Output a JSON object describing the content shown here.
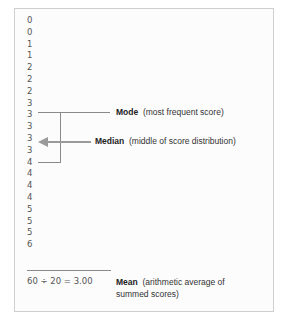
{
  "scores": [
    "0",
    "0",
    "1",
    "1",
    "2",
    "2",
    "2",
    "3",
    "3",
    "3",
    "3",
    "3",
    "4",
    "4",
    "4",
    "4",
    "5",
    "5",
    "5",
    "6"
  ],
  "mode": {
    "term": "Mode",
    "description": "(most frequent score)"
  },
  "median": {
    "term": "Median",
    "description": "(middle of score distribution)"
  },
  "mean": {
    "term": "Mean",
    "description_line1": "(arithmetic average of",
    "description_line2": "summed scores)"
  },
  "formula": "60 ÷ 20 = 3.00"
}
